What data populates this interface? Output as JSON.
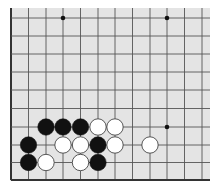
{
  "board": {
    "background": "#e4e4e4",
    "line_color": "#555555",
    "edge_color": "#333333",
    "region": {
      "x": 10,
      "y": 8,
      "w": 200,
      "h": 173
    },
    "columns_x": [
      11,
      28.5,
      46,
      63,
      80.5,
      98,
      115,
      132.5,
      150,
      167,
      184.5,
      202
    ],
    "rows_y": [
      18,
      36,
      54,
      72,
      90,
      108.5,
      127,
      145,
      162.5,
      180
    ],
    "edges": [
      "left",
      "bottom"
    ],
    "star_points": [
      {
        "col": 3,
        "row": 0
      },
      {
        "col": 9,
        "row": 0
      },
      {
        "col": 9,
        "row": 6
      }
    ],
    "stone_radius": 8.2,
    "stones": [
      {
        "color": "black",
        "col": 2,
        "row": 6
      },
      {
        "color": "black",
        "col": 3,
        "row": 6
      },
      {
        "color": "black",
        "col": 4,
        "row": 6
      },
      {
        "color": "white",
        "col": 5,
        "row": 6
      },
      {
        "color": "white",
        "col": 6,
        "row": 6
      },
      {
        "color": "black",
        "col": 1,
        "row": 7
      },
      {
        "color": "white",
        "col": 3,
        "row": 7
      },
      {
        "color": "white",
        "col": 4,
        "row": 7
      },
      {
        "color": "black",
        "col": 5,
        "row": 7
      },
      {
        "color": "white",
        "col": 6,
        "row": 7
      },
      {
        "color": "white",
        "col": 8,
        "row": 7
      },
      {
        "color": "black",
        "col": 1,
        "row": 8
      },
      {
        "color": "white",
        "col": 2,
        "row": 8
      },
      {
        "color": "white",
        "col": 4,
        "row": 8
      },
      {
        "color": "black",
        "col": 5,
        "row": 8
      }
    ]
  }
}
